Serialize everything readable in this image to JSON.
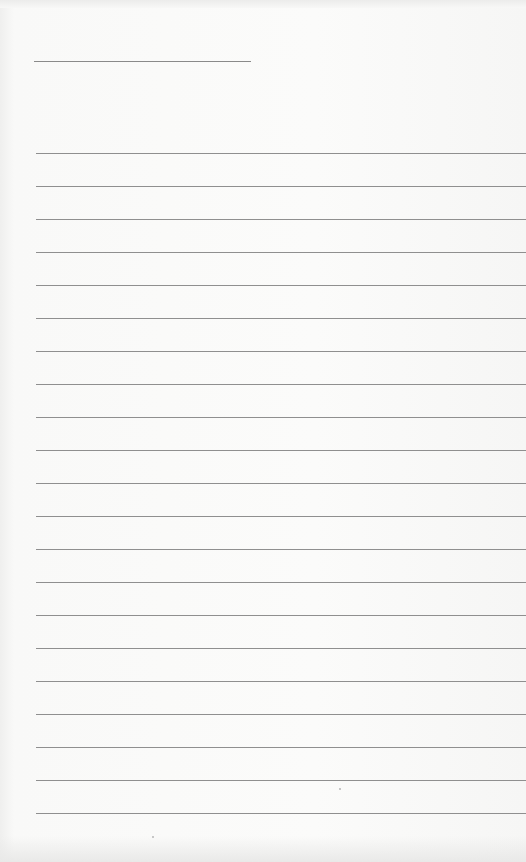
{
  "document": {
    "type": "blank lined page",
    "title_line": {
      "present": true
    },
    "ruled_lines": {
      "count": 21,
      "first_top_px": 153,
      "spacing_px": 33
    },
    "colors": {
      "paper": "#f7f7f6",
      "line": "#8f8f8f"
    }
  }
}
